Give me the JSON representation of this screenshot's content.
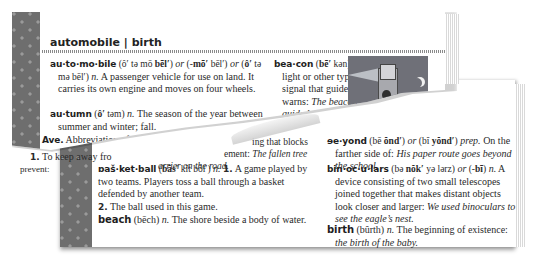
{
  "running_head": "automobile | birth",
  "top_page": {
    "left_column": [
      {
        "headword": "au·to·mo·bile",
        "pron1": "(ô′ tə mō ",
        "pron1_bold": "bēl′",
        "pron1_end": ")",
        "or1": "or",
        "pron2": " (-",
        "pron2_bold": "mō′",
        "pron2_end": " bēl′)",
        "or2": "or",
        "pron3_open": " (",
        "pron3_bold": "ô′",
        "pron3_end": " tə mə bēl′)",
        "pos": "n.",
        "definition": "A passenger vehicle for use on land. It carries its own engine and moves on four wheels."
      },
      {
        "headword": "au·tumn",
        "pron_open": "(",
        "pron_bold": "ô′",
        "pron_end": " təm)",
        "pos": "n.",
        "definition": "The season of the year between summer and winter; fall."
      },
      {
        "headword": "Ave.",
        "definition": "Abbreviation of",
        "ref": "Avenue."
      },
      {
        "headword": "a·void",
        "pron_open": "(ə ",
        "pron_bold": "void′",
        "pron_end": ")",
        "pos": "v.",
        "forms": "a·void·ed, a·void·in",
        "sense_number": "1.",
        "definition_visible": "To keep away fro",
        "line2": "prevent:",
        "fragment_right1": "ing that blocks",
        "fragment_right2": "ement: ",
        "fragment_right2_it": "The fallen tree",
        "fragment_right3_it": "arrier on the road."
      }
    ],
    "right_column": [
      {
        "headword": "bea·con",
        "pron_open": "(",
        "pron_bold": "bē′",
        "pron_end": " kən)",
        "pos": "n.",
        "definition": "A light or other type of signal that guides or warns:",
        "example": "The beacon guided the ship to the dock."
      },
      {
        "headword": "beau·ti·ful",
        "pron_fragment": "(",
        "line2_fragment": "ədi. 11"
      }
    ],
    "illustration": "lighthouse-beacon-at-night"
  },
  "bottom_page": {
    "left_column": [
      {
        "headword": "bas·ket·ball",
        "headword_visible": "ɒaš·ket·ball",
        "pron_open": "(",
        "pron_bold": "băs′",
        "pron_end": " kĭt bôl′)",
        "pos": "n.",
        "sense1_number": "1.",
        "sense1": "A game played by two teams. Players toss a ball through a basket defended by another team.",
        "sense2_number": "2.",
        "sense2": "The ball used in this game."
      },
      {
        "headword": "beach",
        "pron": "(bēch)",
        "pos": "n.",
        "definition": "The shore beside a body of water."
      }
    ],
    "right_column": [
      {
        "headword": "be·yond",
        "headword_visible": "ɘe·yond",
        "pron1_open": "(bē ",
        "pron1_bold": "ŏnd′",
        "pron1_end": ")",
        "or": "or",
        "pron2_open": " (bĭ ",
        "pron2_bold": "yŏnd′",
        "pron2_end": ")",
        "pos": "prep.",
        "definition": "On the farther side of:",
        "example": "His paper route goes beyond the school."
      },
      {
        "headword": "bin·oc·u·lars",
        "pron_open": "(bə ",
        "pron_bold": "nŏk′",
        "pron_end": " yə lərz)",
        "or": "or",
        "pron2_open": " (-",
        "pron2_bold": "bī",
        "pron2_end": ")",
        "pos": "n.",
        "definition": "A device consisting of two small telescopes joined together that makes distant objects look closer and larger:",
        "example": "We used binoculars to see the eagle’s nest."
      },
      {
        "headword": "birth",
        "pron": "(bûrth)",
        "pos": "n.",
        "definition": "The beginning of existence:",
        "example": "the birth of the baby."
      }
    ]
  },
  "colors": {
    "spine": "#6e6e6e",
    "spine_dot": "#9a9a9a",
    "page": "#ffffff",
    "text": "#2a2a2a",
    "illustration_bg": "#6f7078"
  }
}
